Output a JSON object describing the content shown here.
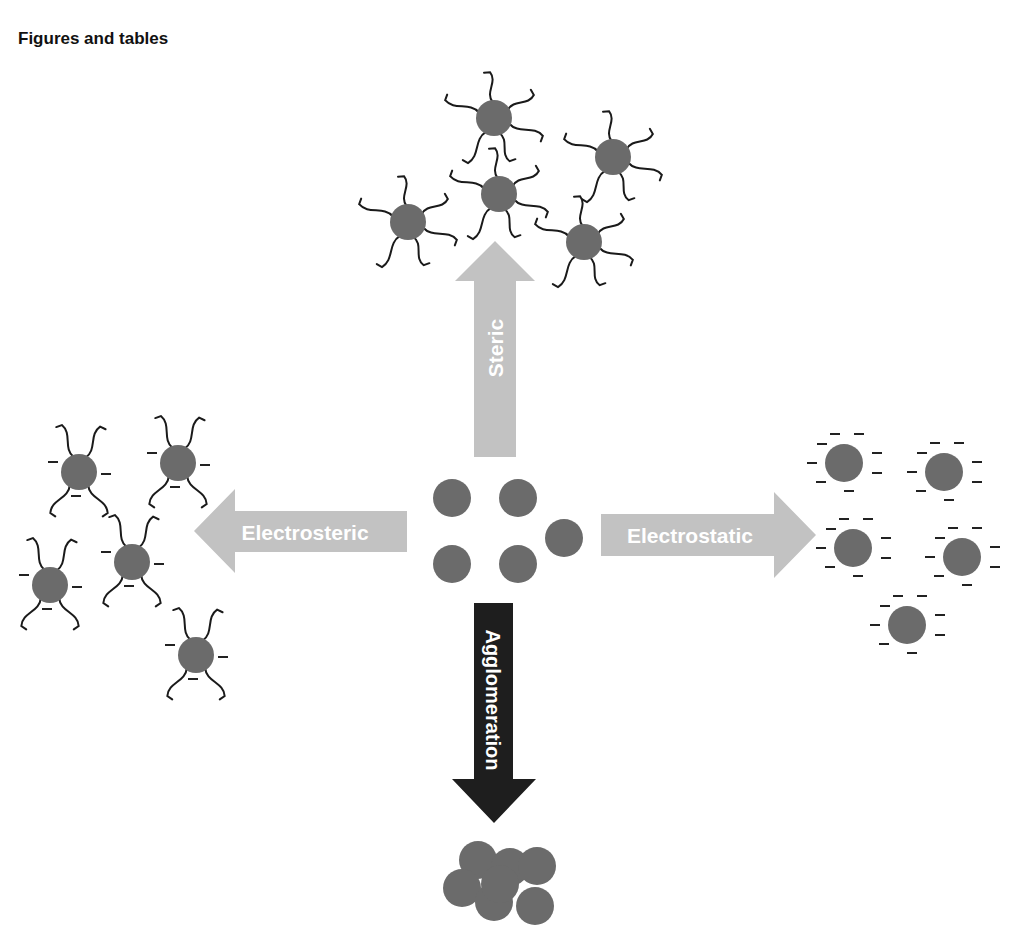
{
  "heading": "Figures and tables",
  "colors": {
    "particle": "#6b6b6b",
    "light_arrow": "#c2c2c2",
    "dark_arrow": "#1e1e1e",
    "tail": "#1a1a1a",
    "label_text": "#ffffff"
  },
  "arrows": {
    "steric": {
      "label": "Steric",
      "direction": "up"
    },
    "electrosteric": {
      "label": "Electrosteric",
      "direction": "left"
    },
    "electrostatic": {
      "label": "Electrostatic",
      "direction": "right"
    },
    "agglomeration": {
      "label": "Agglomeration",
      "direction": "down"
    }
  },
  "groups": {
    "center": {
      "name": "Dispersed nanoparticles",
      "particles": [
        [
          452,
          498
        ],
        [
          518,
          498
        ],
        [
          564,
          538
        ],
        [
          452,
          564
        ],
        [
          518,
          564
        ]
      ]
    },
    "steric": {
      "name": "Sterically stabilized particles",
      "particles": [
        [
          408,
          222
        ],
        [
          494,
          118
        ],
        [
          499,
          194
        ],
        [
          613,
          157
        ],
        [
          584,
          242
        ]
      ]
    },
    "electrosteric": {
      "name": "Electrosterically stabilized particles",
      "particles": [
        [
          79,
          472
        ],
        [
          178,
          463
        ],
        [
          132,
          562
        ],
        [
          50,
          585
        ],
        [
          196,
          655
        ]
      ]
    },
    "electrostatic": {
      "name": "Electrostatically stabilized particles",
      "particles": [
        [
          844,
          463
        ],
        [
          944,
          472
        ],
        [
          853,
          548
        ],
        [
          962,
          557
        ],
        [
          907,
          625
        ]
      ]
    },
    "agglomerate": {
      "name": "Agglomerated particles",
      "particles": [
        [
          478,
          860
        ],
        [
          510,
          867
        ],
        [
          537,
          866
        ],
        [
          462,
          888
        ],
        [
          494,
          902
        ],
        [
          535,
          906
        ],
        [
          500,
          884
        ]
      ]
    }
  },
  "charge_symbol": "−"
}
